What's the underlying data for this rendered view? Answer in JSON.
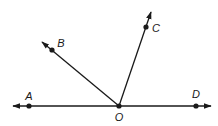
{
  "diagram": {
    "type": "geometry-angles",
    "vertex": {
      "label": "O",
      "x": 119,
      "y": 106
    },
    "points": [
      {
        "label": "A",
        "x": 29,
        "y": 106,
        "label_x": 29,
        "label_y": 100
      },
      {
        "label": "B",
        "x": 52,
        "y": 50,
        "label_x": 61,
        "label_y": 47
      },
      {
        "label": "C",
        "x": 146,
        "y": 27,
        "label_x": 156,
        "label_y": 32
      },
      {
        "label": "D",
        "x": 196,
        "y": 106,
        "label_x": 196,
        "label_y": 98
      },
      {
        "label": "O",
        "x": 119,
        "y": 106,
        "label_x": 119,
        "label_y": 121
      }
    ],
    "rays": [
      {
        "name": "ray-OA",
        "from": "O",
        "through": "A",
        "tip_x": 13,
        "tip_y": 106
      },
      {
        "name": "ray-OD",
        "from": "O",
        "through": "D",
        "tip_x": 211,
        "tip_y": 106
      },
      {
        "name": "ray-OB",
        "from": "O",
        "through": "B",
        "tip_x": 42,
        "tip_y": 42
      },
      {
        "name": "ray-OC",
        "from": "O",
        "through": "C",
        "tip_x": 151,
        "tip_y": 12
      }
    ],
    "stroke_color": "#1a1a1a",
    "background_color": "#ffffff"
  }
}
